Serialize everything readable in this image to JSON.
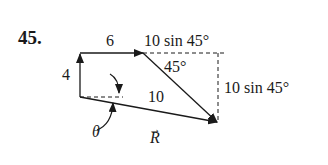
{
  "problem_number": "45.",
  "labels": {
    "top_vector": "6",
    "left_vector": "4",
    "diagonal_vector": "10",
    "horizontal_component": "10 sin 45°",
    "vertical_component": "10 sin 45°",
    "angle_45": "45°",
    "theta": "θ",
    "resultant": "R"
  },
  "vectors": [
    {
      "name": "vertical",
      "from": [
        80,
        97
      ],
      "to": [
        80,
        53
      ],
      "magnitude": 4
    },
    {
      "name": "horizontal",
      "from": [
        80,
        53
      ],
      "to": [
        143,
        53
      ],
      "magnitude": 6
    },
    {
      "name": "diagonal",
      "from": [
        143,
        53
      ],
      "to": [
        217,
        122
      ],
      "magnitude": 10
    },
    {
      "name": "resultant",
      "from": [
        80,
        97
      ],
      "to": [
        217,
        122
      ],
      "label": "R"
    }
  ],
  "colors": {
    "ink": "#1a1a1a",
    "background": "#ffffff"
  }
}
